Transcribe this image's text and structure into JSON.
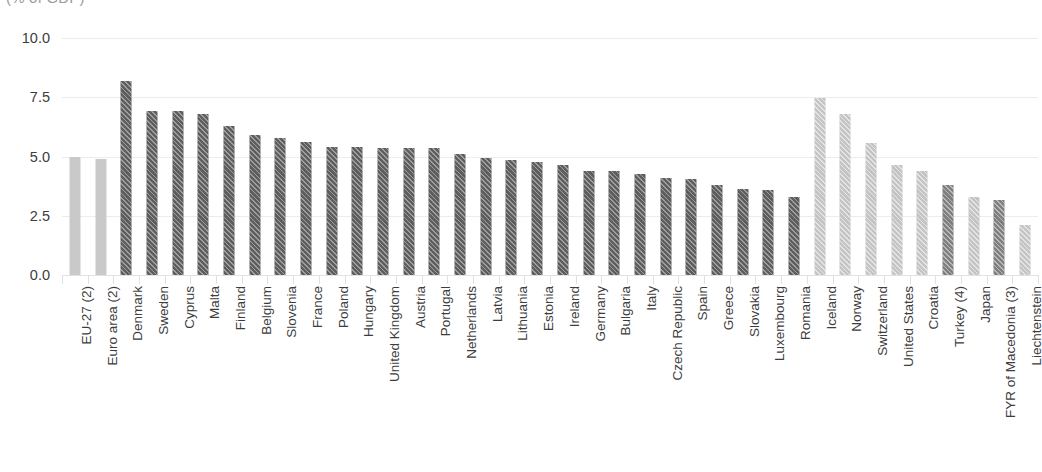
{
  "subtitle": "(% of GDP)",
  "axis": {
    "y_tick_labels": [
      "10.0",
      "7.5",
      "5.0",
      "2.5",
      "0.0"
    ]
  },
  "colors": {
    "aggregate_bar": "#c9c9c9",
    "member_state_bar": "#5e5e5e",
    "non_member_light": "#c4c4c4",
    "non_member_dark": "#7f7f7f",
    "gridline": "#ececec",
    "text": "#3d3d3d",
    "subtitle_text": "#9b9b9b"
  },
  "chart_data": {
    "type": "bar",
    "title": "",
    "subtitle": "(% of GDP)",
    "xlabel": "",
    "ylabel": "",
    "ylim": [
      0,
      10
    ],
    "yticks": [
      0.0,
      2.5,
      5.0,
      7.5,
      10.0
    ],
    "grid": true,
    "legend": "none",
    "orientation": "vertical",
    "categories": [
      "EU-27 (2)",
      "Euro area (2)",
      "Denmark",
      "Sweden",
      "Cyprus",
      "Malta",
      "Finland",
      "Belgium",
      "Slovenia",
      "France",
      "Poland",
      "Hungary",
      "United Kingdom",
      "Austria",
      "Portugal",
      "Netherlands",
      "Latvia",
      "Lithuania",
      "Estonia",
      "Ireland",
      "Germany",
      "Bulgaria",
      "Italy",
      "Czech Republic",
      "Spain",
      "Greece",
      "Slovakia",
      "Luxembourg",
      "Romania",
      "Iceland",
      "Norway",
      "Switzerland",
      "United States",
      "Croatia",
      "Turkey (4)",
      "Japan",
      "FYR of Macedonia (3)",
      "Liechtenstein"
    ],
    "values": [
      5.0,
      4.9,
      8.2,
      6.9,
      6.9,
      6.8,
      6.3,
      5.9,
      5.8,
      5.6,
      5.4,
      5.4,
      5.35,
      5.35,
      5.35,
      5.1,
      4.95,
      4.85,
      4.75,
      4.65,
      4.4,
      4.4,
      4.25,
      4.1,
      4.05,
      3.8,
      3.65,
      3.6,
      3.3,
      7.45,
      6.8,
      5.55,
      4.65,
      4.4,
      3.8,
      3.3,
      3.15,
      2.1
    ],
    "group": [
      "aggregate",
      "aggregate",
      "member",
      "member",
      "member",
      "member",
      "member",
      "member",
      "member",
      "member",
      "member",
      "member",
      "member",
      "member",
      "member",
      "member",
      "member",
      "member",
      "member",
      "member",
      "member",
      "member",
      "member",
      "member",
      "member",
      "member",
      "member",
      "member",
      "member",
      "non-member-light",
      "non-member-light",
      "non-member-light",
      "non-member-light",
      "non-member-light",
      "non-member-dark",
      "non-member-light",
      "non-member-dark",
      "non-member-light"
    ]
  }
}
